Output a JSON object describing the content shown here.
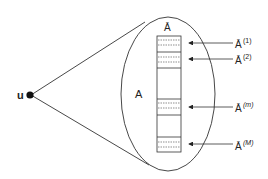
{
  "diagram": {
    "source_node": {
      "label": "u"
    },
    "ellipse": {
      "label": "A"
    },
    "column": {
      "label": "Ā"
    },
    "subsets": [
      {
        "label": "Ā",
        "sup": "(1)"
      },
      {
        "label": "Ā",
        "sup": "(2)"
      },
      {
        "label": "Ā",
        "sup": "(m)"
      },
      {
        "label": "Ā",
        "sup": "(M)"
      }
    ],
    "colors": {
      "stroke": "#222222",
      "background": "#ffffff"
    }
  }
}
